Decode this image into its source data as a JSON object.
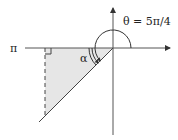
{
  "diagram": {
    "type": "reference-angle",
    "theta_label": "θ = 5π/4",
    "alpha_label": "α",
    "pi_label": "π",
    "colors": {
      "axis": "#555555",
      "line": "#444444",
      "fill": "#e6e6e6",
      "text": "#222222"
    }
  }
}
